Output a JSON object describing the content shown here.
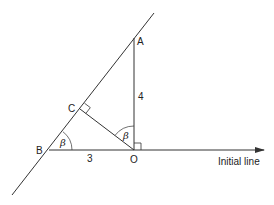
{
  "diagram": {
    "points": {
      "A": {
        "label": "A",
        "x": 134,
        "y": 38
      },
      "B": {
        "label": "B",
        "x": 49,
        "y": 150
      },
      "C": {
        "label": "C",
        "x": 80,
        "y": 109
      },
      "O": {
        "label": "O",
        "x": 134,
        "y": 150
      }
    },
    "lengths": {
      "OA": "4",
      "OB": "3"
    },
    "angles": {
      "at_B": "β",
      "at_O": "β"
    },
    "initial_line_label": "Initial line",
    "colors": {
      "line": "#333333",
      "text": "#222222",
      "background": "#ffffff"
    }
  }
}
